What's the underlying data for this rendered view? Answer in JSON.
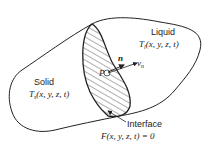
{
  "regions": {
    "liquid": {
      "label": "Liquid",
      "temp": "T",
      "sub": "l",
      "args": "(x, y, z, t)"
    },
    "solid": {
      "label": "Solid",
      "temp": "T",
      "sub": "s",
      "args": "(x, y, z, t)"
    }
  },
  "interface": {
    "label": "Interface",
    "equation": "F(x, y, z, t) = 0"
  },
  "vectors": {
    "normal": "n",
    "velocity": "v",
    "velocity_sub": "n"
  },
  "point": {
    "label": "P"
  }
}
